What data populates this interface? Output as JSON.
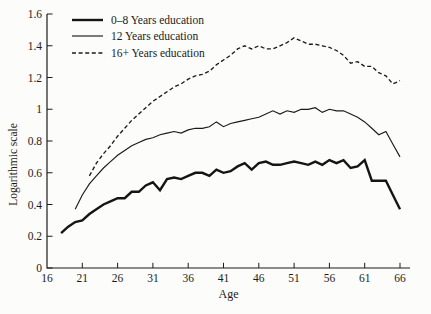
{
  "figure": {
    "background": "#fcfcfa",
    "ink_color": "#1b1b1b"
  },
  "legend": {
    "items": [
      {
        "label": "0–8 Years education",
        "style": "thick-solid"
      },
      {
        "label": "12 Years education",
        "style": "thin-solid"
      },
      {
        "label": "16+ Years education",
        "style": "dashed"
      }
    ]
  },
  "chart_data": {
    "type": "line",
    "title": "",
    "xlabel": "Age",
    "ylabel": "Logarithmic scale",
    "xlim": [
      16,
      66
    ],
    "ylim": [
      0,
      1.6
    ],
    "grid": false,
    "legend_position": "top-left-inside",
    "x_ticks": [
      16,
      21,
      26,
      31,
      36,
      41,
      46,
      51,
      56,
      61,
      66
    ],
    "x_tick_labels": [
      "16",
      "21",
      "26",
      "31",
      "36",
      "41",
      "46",
      "51",
      "56",
      "61",
      "66"
    ],
    "y_ticks": [
      0,
      0.2,
      0.4,
      0.6,
      0.8,
      1.0,
      1.2,
      1.4,
      1.6
    ],
    "y_tick_labels": [
      "0",
      "0.2",
      "0.4",
      "0.6",
      "0.8",
      "1",
      "1.2",
      "1.4",
      "1.6"
    ],
    "series": [
      {
        "name": "0–8 Years education",
        "style": "thick-solid",
        "ages": [
          18,
          19,
          20,
          21,
          22,
          23,
          24,
          25,
          26,
          27,
          28,
          29,
          30,
          31,
          32,
          33,
          34,
          35,
          36,
          37,
          38,
          39,
          40,
          41,
          42,
          43,
          44,
          45,
          46,
          47,
          48,
          49,
          50,
          51,
          52,
          53,
          54,
          55,
          56,
          57,
          58,
          59,
          60,
          61,
          62,
          63,
          64,
          65,
          66
        ],
        "values": [
          0.22,
          0.26,
          0.29,
          0.3,
          0.34,
          0.37,
          0.4,
          0.42,
          0.44,
          0.44,
          0.48,
          0.48,
          0.52,
          0.54,
          0.49,
          0.56,
          0.57,
          0.56,
          0.58,
          0.6,
          0.6,
          0.58,
          0.62,
          0.6,
          0.61,
          0.64,
          0.66,
          0.62,
          0.66,
          0.67,
          0.65,
          0.65,
          0.66,
          0.67,
          0.66,
          0.65,
          0.67,
          0.65,
          0.68,
          0.66,
          0.68,
          0.63,
          0.64,
          0.68,
          0.55,
          0.55,
          0.55,
          0.46,
          0.37
        ]
      },
      {
        "name": "12 Years education",
        "style": "thin-solid",
        "ages": [
          20,
          21,
          22,
          23,
          24,
          25,
          26,
          27,
          28,
          29,
          30,
          31,
          32,
          33,
          34,
          35,
          36,
          37,
          38,
          39,
          40,
          41,
          42,
          43,
          44,
          45,
          46,
          47,
          48,
          49,
          50,
          51,
          52,
          53,
          54,
          55,
          56,
          57,
          58,
          59,
          60,
          61,
          62,
          63,
          64,
          65,
          66
        ],
        "values": [
          0.37,
          0.46,
          0.53,
          0.58,
          0.63,
          0.67,
          0.71,
          0.74,
          0.77,
          0.79,
          0.81,
          0.82,
          0.84,
          0.85,
          0.86,
          0.85,
          0.87,
          0.88,
          0.88,
          0.89,
          0.92,
          0.89,
          0.91,
          0.92,
          0.93,
          0.94,
          0.95,
          0.97,
          0.99,
          0.97,
          0.99,
          0.98,
          1.0,
          1.0,
          1.01,
          0.98,
          1.0,
          0.99,
          0.99,
          0.97,
          0.95,
          0.92,
          0.88,
          0.84,
          0.86,
          0.78,
          0.7
        ]
      },
      {
        "name": "16+ Years education",
        "style": "dashed",
        "ages": [
          22,
          23,
          24,
          25,
          26,
          27,
          28,
          29,
          30,
          31,
          32,
          33,
          34,
          35,
          36,
          37,
          38,
          39,
          40,
          41,
          42,
          43,
          44,
          45,
          46,
          47,
          48,
          49,
          50,
          51,
          52,
          53,
          54,
          55,
          56,
          57,
          58,
          59,
          60,
          61,
          62,
          63,
          64,
          65,
          66
        ],
        "values": [
          0.58,
          0.66,
          0.72,
          0.77,
          0.83,
          0.88,
          0.93,
          0.97,
          1.01,
          1.05,
          1.08,
          1.11,
          1.14,
          1.16,
          1.19,
          1.21,
          1.22,
          1.24,
          1.28,
          1.31,
          1.34,
          1.38,
          1.4,
          1.38,
          1.4,
          1.38,
          1.38,
          1.4,
          1.42,
          1.45,
          1.43,
          1.41,
          1.41,
          1.4,
          1.39,
          1.37,
          1.34,
          1.29,
          1.3,
          1.27,
          1.27,
          1.23,
          1.21,
          1.16,
          1.18
        ]
      }
    ]
  }
}
